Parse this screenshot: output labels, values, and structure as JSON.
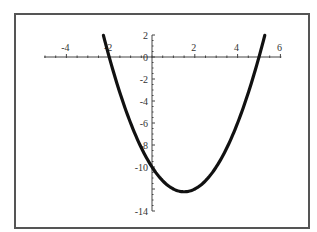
{
  "chart_data": {
    "type": "line",
    "title": "",
    "xlabel": "",
    "ylabel": "",
    "function": "y = x^2 - 3x - 10",
    "xlim": [
      -5,
      6
    ],
    "ylim": [
      -14,
      2
    ],
    "grid": false,
    "legend": null,
    "x_ticks": [
      -4,
      -2,
      2,
      4,
      6
    ],
    "x_tick_labels": [
      "-4",
      "-2",
      "2",
      "4",
      "6"
    ],
    "y_ticks": [
      2,
      0,
      -2,
      -4,
      -6,
      -8,
      -10,
      -14
    ],
    "y_tick_labels": [
      "2",
      "0",
      "-2",
      "-4",
      "-6",
      "-8",
      "-10",
      "-14"
    ],
    "series": [
      {
        "name": "parabola",
        "color": "#111111",
        "x": [
          -2.27,
          -2,
          -1.5,
          -1,
          -0.5,
          0,
          0.5,
          1,
          1.5,
          2,
          2.5,
          3,
          3.5,
          4,
          4.5,
          5,
          5.27
        ],
        "y": [
          2.0,
          0,
          -3.25,
          -6,
          -8.25,
          -10,
          -11.25,
          -12,
          -12.25,
          -12,
          -11.25,
          -10,
          -8.25,
          -6,
          -3.25,
          0,
          2.0
        ]
      }
    ],
    "annotations": {
      "roots": [
        -2,
        5
      ],
      "vertex": [
        1.5,
        -12.25
      ],
      "y_intercept": -10
    }
  },
  "axes": {
    "origin_px": [
      152,
      57
    ],
    "px_per_unit_x": 21.4,
    "px_per_unit_y": 11,
    "axis_color": "#444444",
    "curve_color": "#111111"
  }
}
